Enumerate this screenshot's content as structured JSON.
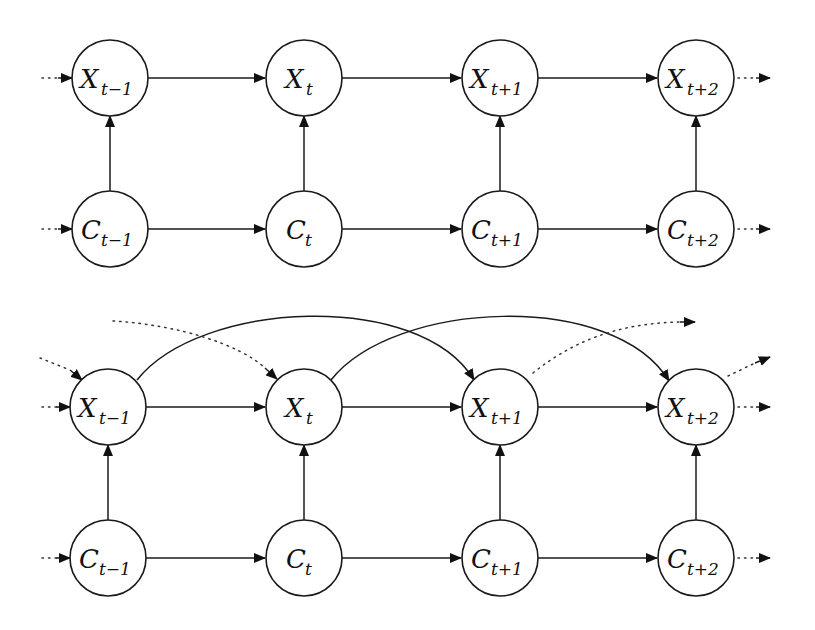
{
  "diagrams": [
    {
      "name": "top-diagram",
      "nodes": [
        {
          "id": "X_t-1",
          "base": "X",
          "sub": "t−1",
          "x": 110,
          "y": 78
        },
        {
          "id": "X_t",
          "base": "X",
          "sub": "t",
          "x": 304,
          "y": 78
        },
        {
          "id": "X_t+1",
          "base": "X",
          "sub": "t+1",
          "x": 500,
          "y": 78
        },
        {
          "id": "X_t+2",
          "base": "X",
          "sub": "t+2",
          "x": 696,
          "y": 78
        },
        {
          "id": "C_t-1",
          "base": "C",
          "sub": "t−1",
          "x": 110,
          "y": 229
        },
        {
          "id": "C_t",
          "base": "C",
          "sub": "t",
          "x": 304,
          "y": 229
        },
        {
          "id": "C_t+1",
          "base": "C",
          "sub": "t+1",
          "x": 500,
          "y": 229
        },
        {
          "id": "C_t+2",
          "base": "C",
          "sub": "t+2",
          "x": 696,
          "y": 229
        }
      ],
      "edges": [
        {
          "from": "X_t-1",
          "to": "X_t",
          "style": "solid"
        },
        {
          "from": "X_t",
          "to": "X_t+1",
          "style": "solid"
        },
        {
          "from": "X_t+1",
          "to": "X_t+2",
          "style": "solid"
        },
        {
          "from": "C_t-1",
          "to": "C_t",
          "style": "solid"
        },
        {
          "from": "C_t",
          "to": "C_t+1",
          "style": "solid"
        },
        {
          "from": "C_t+1",
          "to": "C_t+2",
          "style": "solid"
        },
        {
          "from": "C_t-1",
          "to": "X_t-1",
          "style": "solid"
        },
        {
          "from": "C_t",
          "to": "X_t",
          "style": "solid"
        },
        {
          "from": "C_t+1",
          "to": "X_t+1",
          "style": "solid"
        },
        {
          "from": "C_t+2",
          "to": "X_t+2",
          "style": "solid"
        },
        {
          "from": "...",
          "to": "X_t-1",
          "style": "dotted"
        },
        {
          "from": "...",
          "to": "C_t-1",
          "style": "dotted"
        },
        {
          "from": "X_t+2",
          "to": "...",
          "style": "dotted"
        },
        {
          "from": "C_t+2",
          "to": "...",
          "style": "dotted"
        }
      ]
    },
    {
      "name": "bottom-diagram",
      "nodes": [
        {
          "id": "X_t-1",
          "base": "X",
          "sub": "t−1",
          "x": 108,
          "y": 407
        },
        {
          "id": "X_t",
          "base": "X",
          "sub": "t",
          "x": 304,
          "y": 407
        },
        {
          "id": "X_t+1",
          "base": "X",
          "sub": "t+1",
          "x": 500,
          "y": 407
        },
        {
          "id": "X_t+2",
          "base": "X",
          "sub": "t+2",
          "x": 696,
          "y": 407
        },
        {
          "id": "C_t-1",
          "base": "C",
          "sub": "t−1",
          "x": 108,
          "y": 558
        },
        {
          "id": "C_t",
          "base": "C",
          "sub": "t",
          "x": 304,
          "y": 558
        },
        {
          "id": "C_t+1",
          "base": "C",
          "sub": "t+1",
          "x": 500,
          "y": 558
        },
        {
          "id": "C_t+2",
          "base": "C",
          "sub": "t+2",
          "x": 696,
          "y": 558
        }
      ],
      "edges": [
        {
          "from": "X_t-1",
          "to": "X_t",
          "style": "solid"
        },
        {
          "from": "X_t",
          "to": "X_t+1",
          "style": "solid"
        },
        {
          "from": "X_t+1",
          "to": "X_t+2",
          "style": "solid"
        },
        {
          "from": "C_t-1",
          "to": "C_t",
          "style": "solid"
        },
        {
          "from": "C_t",
          "to": "C_t+1",
          "style": "solid"
        },
        {
          "from": "C_t+1",
          "to": "C_t+2",
          "style": "solid"
        },
        {
          "from": "C_t-1",
          "to": "X_t-1",
          "style": "solid"
        },
        {
          "from": "C_t",
          "to": "X_t",
          "style": "solid"
        },
        {
          "from": "C_t+1",
          "to": "X_t+1",
          "style": "solid"
        },
        {
          "from": "C_t+2",
          "to": "X_t+2",
          "style": "solid"
        },
        {
          "from": "X_t-1",
          "to": "X_t+1",
          "style": "solid-arc"
        },
        {
          "from": "X_t",
          "to": "X_t+2",
          "style": "solid-arc"
        },
        {
          "from": "...",
          "to": "X_t-1",
          "style": "dotted"
        },
        {
          "from": "...",
          "to": "X_t-1",
          "style": "dotted-diagonal"
        },
        {
          "from": "...",
          "to": "X_t",
          "style": "dotted-arc"
        },
        {
          "from": "X_t+1",
          "to": "...",
          "style": "dotted-arc"
        },
        {
          "from": "X_t+2",
          "to": "...",
          "style": "dotted-diagonal"
        },
        {
          "from": "X_t+2",
          "to": "...",
          "style": "dotted"
        },
        {
          "from": "...",
          "to": "C_t-1",
          "style": "dotted"
        },
        {
          "from": "C_t+2",
          "to": "...",
          "style": "dotted"
        }
      ]
    }
  ],
  "labels": {
    "top": {
      "X_t-1": {
        "base": "X",
        "sub": "t−1"
      },
      "X_t": {
        "base": "X",
        "sub": "t"
      },
      "X_t+1": {
        "base": "X",
        "sub": "t+1"
      },
      "X_t+2": {
        "base": "X",
        "sub": "t+2"
      },
      "C_t-1": {
        "base": "C",
        "sub": "t−1"
      },
      "C_t": {
        "base": "C",
        "sub": "t"
      },
      "C_t+1": {
        "base": "C",
        "sub": "t+1"
      },
      "C_t+2": {
        "base": "C",
        "sub": "t+2"
      }
    },
    "bottom": {
      "X_t-1": {
        "base": "X",
        "sub": "t−1"
      },
      "X_t": {
        "base": "X",
        "sub": "t"
      },
      "X_t+1": {
        "base": "X",
        "sub": "t+1"
      },
      "X_t+2": {
        "base": "X",
        "sub": "t+2"
      },
      "C_t-1": {
        "base": "C",
        "sub": "t−1"
      },
      "C_t": {
        "base": "C",
        "sub": "t"
      },
      "C_t+1": {
        "base": "C",
        "sub": "t+1"
      },
      "C_t+2": {
        "base": "C",
        "sub": "t+2"
      }
    }
  },
  "style": {
    "stroke_color": "#1a1a1a",
    "background": "#ffffff",
    "node_radius": 38
  }
}
